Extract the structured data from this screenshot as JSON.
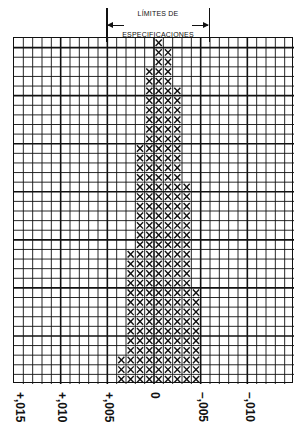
{
  "header": {
    "line1": "LÍMITES DE",
    "line2": "ESPECIFICACIONES"
  },
  "x_tick_labels": [
    "+,015",
    "+,010",
    "+,005",
    "0",
    "–,005",
    "–,010"
  ],
  "chart_data": {
    "type": "bar",
    "subtype": "tally-histogram (X marks on grid paper)",
    "title": "LÍMITES DE ESPECIFICACIONES",
    "xlabel": "",
    "ylabel": "",
    "x_ticks": [
      "+,015",
      "+,010",
      "+,005",
      "0",
      "–,005",
      "–,010"
    ],
    "tick_values": [
      0.015,
      0.01,
      0.005,
      0,
      -0.005,
      -0.01
    ],
    "categories": [
      "+,004",
      "+,003",
      "+,002",
      "+,001",
      "0",
      "–,001",
      "–,002",
      "–,003",
      "–,004"
    ],
    "values": [
      3,
      14,
      25,
      33,
      36,
      35,
      31,
      21,
      10
    ],
    "marker": "X",
    "spec_limits": [
      "+,005",
      "–,005"
    ],
    "grid": {
      "columns": 30,
      "rows": 36,
      "major_every": 5
    },
    "ylim": [
      0,
      36
    ]
  },
  "colors": {
    "ink": "#111111",
    "paper": "#ffffff"
  }
}
